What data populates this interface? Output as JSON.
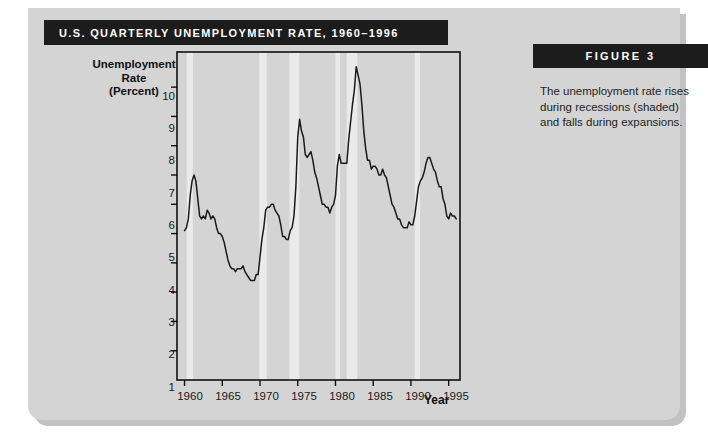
{
  "figure": {
    "title": "U.S. Quarterly Unemployment Rate, 1960–1996",
    "banner_label": "FIGURE 3",
    "caption": "The unemployment rate rises during recessions (shaded) and falls during expansions.",
    "colors": {
      "banner_background": "#1c1c1c",
      "banner_text": "#ffffff",
      "card_background": "#d4d4d4",
      "plot_background": "#ffffff",
      "recession_band": "#eaeaea",
      "line": "#1a1a1a",
      "axis": "#111111"
    }
  },
  "chart_data": {
    "type": "line",
    "title": "U.S. Quarterly Unemployment Rate, 1960–1996",
    "xlabel": "Year",
    "ylabel": "Unemployment Rate (Percent)",
    "ylabel_lines": [
      "Unemployment",
      "Rate",
      "(Percent)"
    ],
    "xlim": [
      1959.0,
      1996.5
    ],
    "ylim": [
      0,
      11.2
    ],
    "grid": false,
    "legend": "none",
    "x_ticks": [
      1960,
      1965,
      1970,
      1975,
      1980,
      1985,
      1990,
      1995
    ],
    "y_ticks": [
      1,
      2,
      3,
      4,
      5,
      6,
      7,
      8,
      9,
      10
    ],
    "series": [
      {
        "name": "Unemployment Rate (Percent)",
        "x": [
          1960.0,
          1960.25,
          1960.5,
          1960.75,
          1961.0,
          1961.25,
          1961.5,
          1961.75,
          1962.0,
          1962.25,
          1962.5,
          1962.75,
          1963.0,
          1963.25,
          1963.5,
          1963.75,
          1964.0,
          1964.25,
          1964.5,
          1964.75,
          1965.0,
          1965.25,
          1965.5,
          1965.75,
          1966.0,
          1966.25,
          1966.5,
          1966.75,
          1967.0,
          1967.25,
          1967.5,
          1967.75,
          1968.0,
          1968.25,
          1968.5,
          1968.75,
          1969.0,
          1969.25,
          1969.5,
          1969.75,
          1970.0,
          1970.25,
          1970.5,
          1970.75,
          1971.0,
          1971.25,
          1971.5,
          1971.75,
          1972.0,
          1972.25,
          1972.5,
          1972.75,
          1973.0,
          1973.25,
          1973.5,
          1973.75,
          1974.0,
          1974.25,
          1974.5,
          1974.75,
          1975.0,
          1975.25,
          1975.5,
          1975.75,
          1976.0,
          1976.25,
          1976.5,
          1976.75,
          1977.0,
          1977.25,
          1977.5,
          1977.75,
          1978.0,
          1978.25,
          1978.5,
          1978.75,
          1979.0,
          1979.25,
          1979.5,
          1979.75,
          1980.0,
          1980.25,
          1980.5,
          1980.75,
          1981.0,
          1981.25,
          1981.5,
          1981.75,
          1982.0,
          1982.25,
          1982.5,
          1982.75,
          1983.0,
          1983.25,
          1983.5,
          1983.75,
          1984.0,
          1984.25,
          1984.5,
          1984.75,
          1985.0,
          1985.25,
          1985.5,
          1985.75,
          1986.0,
          1986.25,
          1986.5,
          1986.75,
          1987.0,
          1987.25,
          1987.5,
          1987.75,
          1988.0,
          1988.25,
          1988.5,
          1988.75,
          1989.0,
          1989.25,
          1989.5,
          1989.75,
          1990.0,
          1990.25,
          1990.5,
          1990.75,
          1991.0,
          1991.25,
          1991.5,
          1991.75,
          1992.0,
          1992.25,
          1992.5,
          1992.75,
          1993.0,
          1993.25,
          1993.5,
          1993.75,
          1994.0,
          1994.25,
          1994.5,
          1994.75,
          1995.0,
          1995.25,
          1995.5,
          1995.75,
          1996.0
        ],
        "y": [
          5.1,
          5.2,
          5.5,
          6.3,
          6.8,
          7.0,
          6.8,
          6.2,
          5.6,
          5.5,
          5.6,
          5.5,
          5.8,
          5.7,
          5.5,
          5.6,
          5.5,
          5.2,
          5.0,
          5.0,
          4.9,
          4.7,
          4.4,
          4.1,
          3.9,
          3.8,
          3.8,
          3.7,
          3.8,
          3.8,
          3.8,
          3.9,
          3.7,
          3.6,
          3.5,
          3.4,
          3.4,
          3.4,
          3.6,
          3.6,
          4.2,
          4.8,
          5.2,
          5.8,
          5.9,
          5.9,
          6.0,
          6.0,
          5.8,
          5.7,
          5.6,
          5.3,
          4.9,
          4.9,
          4.8,
          4.8,
          5.1,
          5.2,
          5.6,
          6.6,
          8.3,
          8.9,
          8.5,
          8.3,
          7.7,
          7.6,
          7.7,
          7.8,
          7.5,
          7.1,
          6.9,
          6.6,
          6.3,
          6.0,
          6.0,
          5.9,
          5.9,
          5.7,
          5.9,
          6.0,
          6.3,
          7.3,
          7.7,
          7.4,
          7.4,
          7.4,
          7.4,
          8.2,
          8.8,
          9.4,
          9.9,
          10.7,
          10.4,
          10.1,
          9.4,
          8.5,
          7.9,
          7.5,
          7.5,
          7.2,
          7.3,
          7.3,
          7.2,
          7.0,
          7.0,
          7.2,
          7.0,
          6.9,
          6.6,
          6.3,
          6.0,
          5.9,
          5.7,
          5.5,
          5.5,
          5.3,
          5.2,
          5.2,
          5.2,
          5.4,
          5.3,
          5.3,
          5.6,
          6.1,
          6.6,
          6.8,
          6.9,
          7.1,
          7.4,
          7.6,
          7.6,
          7.4,
          7.2,
          7.1,
          6.8,
          6.6,
          6.6,
          6.2,
          6.0,
          5.6,
          5.5,
          5.7,
          5.6,
          5.6,
          5.5
        ]
      }
    ],
    "shaded_regions": {
      "label": "recessions",
      "bands": [
        {
          "start": 1960.3,
          "end": 1961.1
        },
        {
          "start": 1969.9,
          "end": 1970.9
        },
        {
          "start": 1973.9,
          "end": 1975.2
        },
        {
          "start": 1980.0,
          "end": 1980.6
        },
        {
          "start": 1981.5,
          "end": 1982.9
        },
        {
          "start": 1990.5,
          "end": 1991.2
        }
      ]
    }
  },
  "axes": {
    "y_tick_labels": [
      "10",
      "9",
      "8",
      "7",
      "6",
      "5",
      "4",
      "3",
      "2",
      "1"
    ],
    "x_tick_labels": [
      "1960",
      "1965",
      "1970",
      "1975",
      "1980",
      "1985",
      "1990",
      "1995"
    ],
    "x_title": "Year"
  }
}
